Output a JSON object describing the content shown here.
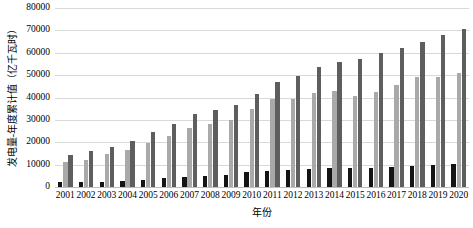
{
  "chart_data": {
    "type": "bar",
    "title": "",
    "subtitle": "",
    "xlabel": "年份",
    "ylabel": "发电量-年度累计值（亿千瓦时）",
    "ylim": [
      0,
      80000
    ],
    "ytick_labels": [
      "80000",
      "70000",
      "60000",
      "50000",
      "40000",
      "30000",
      "20000",
      "10000",
      "0"
    ],
    "ytick_values": [
      80000,
      70000,
      60000,
      50000,
      40000,
      30000,
      20000,
      10000,
      0
    ],
    "grid": true,
    "legend": "none",
    "categories": [
      "2001",
      "2002",
      "2003",
      "2004",
      "2005",
      "2006",
      "2007",
      "2008",
      "2009",
      "2010",
      "2011",
      "2012",
      "2013",
      "2014",
      "2015",
      "2016",
      "2017",
      "2018",
      "2019",
      "2020"
    ],
    "series": [
      {
        "name": "series-1",
        "color": "#141414",
        "values": [
          2100,
          2200,
          2400,
          2800,
          3300,
          4000,
          4500,
          5000,
          5500,
          6500,
          7000,
          7500,
          8000,
          8400,
          8500,
          8700,
          9000,
          9400,
          9800,
          10500
        ]
      },
      {
        "name": "series-2",
        "color": "#a9a9a9",
        "values": [
          11000,
          12200,
          14700,
          16700,
          19800,
          22800,
          26500,
          28300,
          30100,
          34800,
          39200,
          39400,
          42200,
          43000,
          40700,
          42400,
          45600,
          49000,
          49200,
          51100
        ]
      },
      {
        "name": "series-3",
        "color": "#5e5e5e",
        "values": [
          14500,
          16000,
          17900,
          20600,
          24400,
          28100,
          32500,
          34300,
          36800,
          41700,
          46900,
          49400,
          53500,
          56000,
          57400,
          59800,
          62000,
          65000,
          68000,
          70500
        ]
      }
    ]
  }
}
